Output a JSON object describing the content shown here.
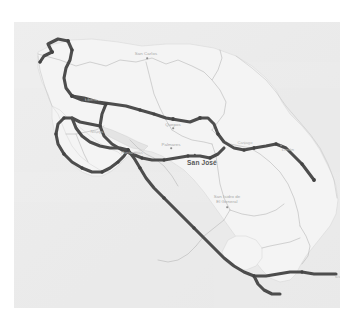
{
  "map": {
    "title": "Costa Rica road trip route map",
    "region": "Costa Rica",
    "style": "washed-out grayscale terrain",
    "background_color": "#e6e6e6",
    "land_color": "#f0f0f0",
    "route_color": "#1a1a1a",
    "border_color": "#9a9a9a",
    "label_color": "#8e8e8e",
    "capital_label_color": "#1f1f1f",
    "frame_color": "#ffffff"
  },
  "labels": [
    {
      "id": "san-carlos",
      "text": "San Carlos",
      "x": 132,
      "y": 29,
      "kind": "city",
      "dot_x": 133,
      "dot_y": 36
    },
    {
      "id": "quesada",
      "text": "Quepos",
      "x": 159,
      "y": 100,
      "kind": "city",
      "dot_x": 159,
      "dot_y": 106
    },
    {
      "id": "palmares",
      "text": "Palmares",
      "x": 157,
      "y": 120,
      "kind": "city",
      "dot_x": 157,
      "dot_y": 126
    },
    {
      "id": "san-jose",
      "text": "San José",
      "x": 188,
      "y": 138,
      "kind": "capital",
      "dot_x": 181,
      "dot_y": 133
    },
    {
      "id": "limon",
      "text": "Limón",
      "x": 274,
      "y": 125,
      "kind": "city",
      "dot_x": 267,
      "dot_y": 123
    },
    {
      "id": "san-isidro",
      "text": "San Isidro de\nEl General",
      "x": 213,
      "y": 172,
      "kind": "city",
      "dot_x": 213,
      "dot_y": 185
    },
    {
      "id": "cartago",
      "text": "Cartago",
      "x": 231,
      "y": 118,
      "kind": "faint",
      "dot_x": 231,
      "dot_y": 122
    },
    {
      "id": "liberia",
      "text": "Liberia",
      "x": 77,
      "y": 75,
      "kind": "faint",
      "dot_x": 72,
      "dot_y": 78
    },
    {
      "id": "puntarenas",
      "text": "Puntarenas",
      "x": 118,
      "y": 128,
      "kind": "faint",
      "dot_x": 121,
      "dot_y": 131
    },
    {
      "id": "nicoya",
      "text": "Nicoya",
      "x": 83,
      "y": 107,
      "kind": "faint",
      "dot_x": 83,
      "dot_y": 111
    },
    {
      "id": "david",
      "text": "David",
      "x": 327,
      "y": 252,
      "kind": "faint",
      "dot_x": 322,
      "dot_y": 255
    }
  ],
  "route": {
    "name": "highlighted road route",
    "stroke_width": 3.1,
    "waypoint_count": 34,
    "segments": [
      "northwest-loop",
      "nicoya-peninsula-loop",
      "central-valley-corridor",
      "caribbean-spur-to-limon",
      "pacific-coast-south-to-border"
    ]
  }
}
